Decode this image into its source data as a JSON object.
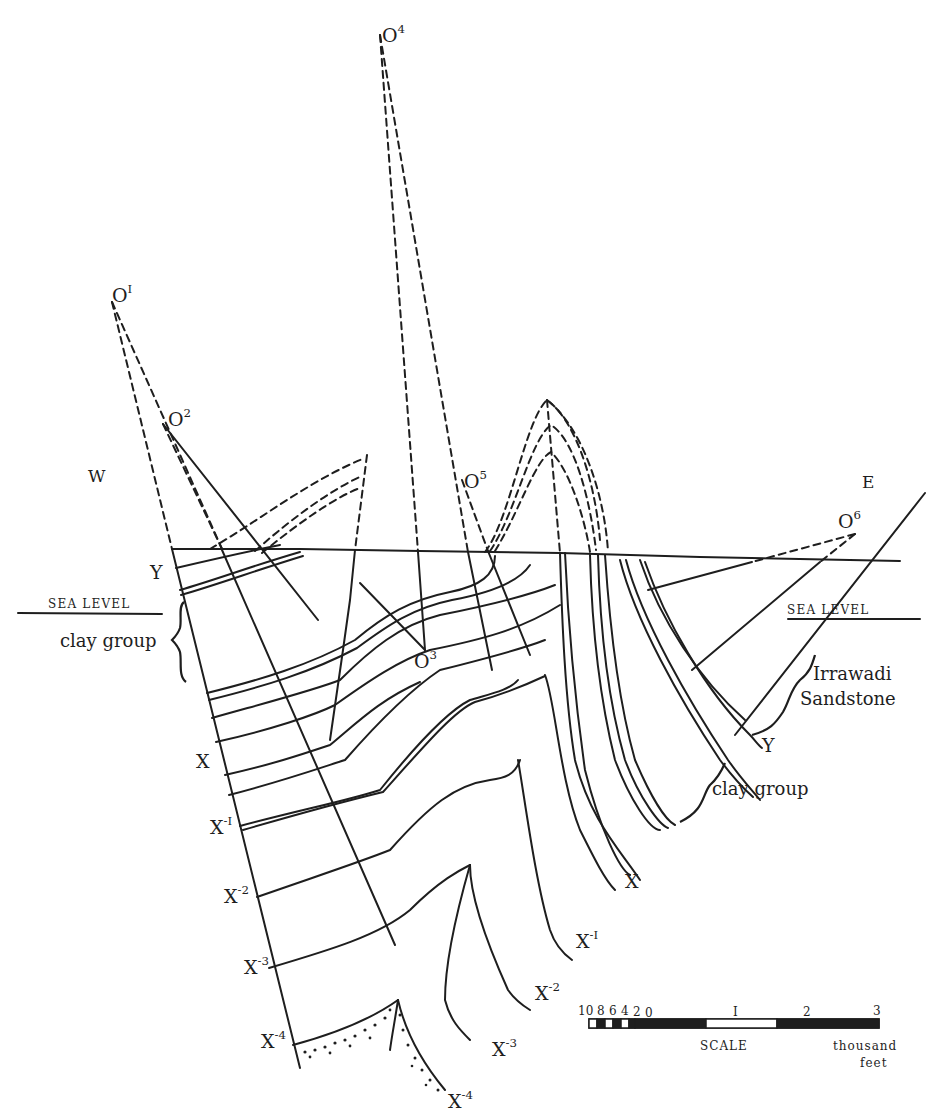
{
  "figure": {
    "type": "geological cross-section",
    "directions": {
      "west": "W",
      "east": "E"
    },
    "centres": [
      {
        "id": "O1",
        "base": "O",
        "sup": "I"
      },
      {
        "id": "O2",
        "base": "O",
        "sup": "2"
      },
      {
        "id": "O3",
        "base": "O",
        "sup": "3"
      },
      {
        "id": "O4",
        "base": "O",
        "sup": "4"
      },
      {
        "id": "O5",
        "base": "O",
        "sup": "5"
      },
      {
        "id": "O6",
        "base": "O",
        "sup": "6"
      }
    ],
    "horizons_west": [
      {
        "base": "Y",
        "sup": ""
      },
      {
        "base": "X",
        "sup": ""
      },
      {
        "base": "X",
        "sup": "-I"
      },
      {
        "base": "X",
        "sup": "-2"
      },
      {
        "base": "X",
        "sup": "-3"
      },
      {
        "base": "X",
        "sup": "-4"
      }
    ],
    "horizons_east": [
      {
        "base": "X",
        "sup": ""
      },
      {
        "base": "X",
        "sup": "-I"
      },
      {
        "base": "X",
        "sup": "-2"
      },
      {
        "base": "X",
        "sup": "-3"
      },
      {
        "base": "X",
        "sup": "-4"
      },
      {
        "base": "Y",
        "sup": ""
      }
    ],
    "sea_level_label": "SEA LEVEL",
    "units": {
      "clay_group": "clay group",
      "irrawadi_line1": "Irrawadi",
      "irrawadi_line2": "Sandstone"
    },
    "scale": {
      "label": "SCALE",
      "unit_line1": "thousand",
      "unit_line2": "feet",
      "sub_ticks": [
        "10",
        "8",
        "6",
        "4",
        "2",
        "0"
      ],
      "main_ticks": [
        "I",
        "2",
        "3"
      ]
    },
    "colors": {
      "ink": "#1e1e1e",
      "paper": "#ffffff"
    }
  }
}
